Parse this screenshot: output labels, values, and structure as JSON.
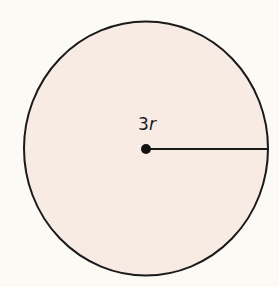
{
  "diagram": {
    "shape": "circle",
    "fill_color": "#f8ebe4",
    "stroke_color": "#1a1a1a",
    "background_color": "#fcfaf4",
    "radius_label": {
      "coefficient": "3",
      "variable": "r"
    },
    "center_point": "filled-dot",
    "radius_segment": "center-to-right-edge"
  }
}
